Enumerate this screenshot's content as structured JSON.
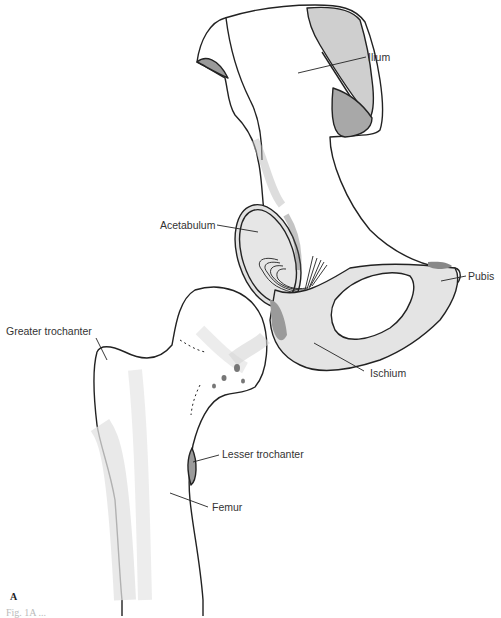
{
  "figure": {
    "panel_label": "A",
    "caption_fragment": "Fig. 1A ...",
    "colors": {
      "line": "#222222",
      "fill_light": "#e6e6e6",
      "fill_mid": "#c8c8c8",
      "fill_dark": "#9a9a9a"
    }
  },
  "labels": {
    "ilium": "Ilium",
    "acetabulum": "Acetabulum",
    "pubis": "Pubis",
    "greater_trochanter": "Greater trochanter",
    "ischium": "Ischium",
    "lesser_trochanter": "Lesser trochanter",
    "femur": "Femur"
  }
}
